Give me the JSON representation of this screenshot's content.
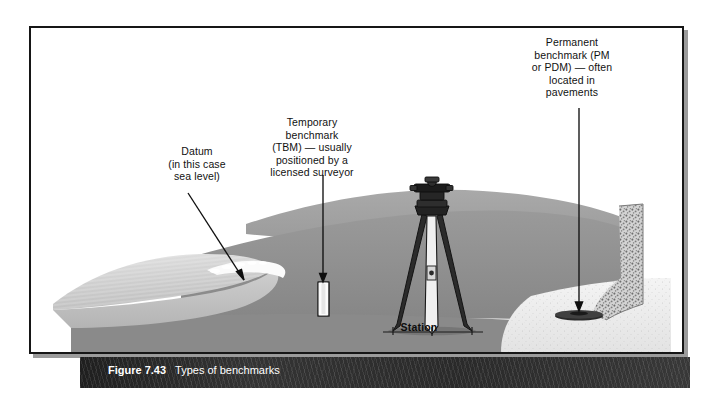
{
  "figure": {
    "number": "Figure 7.43",
    "title": "Types of benchmarks"
  },
  "labels": {
    "datum": "Datum\n(in this case\nsea level)",
    "temporary_benchmark": "Temporary\nbenchmark\n(TBM) — usually\npositioned by a\nlicensed surveyor",
    "permanent_benchmark": "Permanent\nbenchmark (PM\nor PDM) — often\nlocated in\npavements",
    "station": "Station"
  },
  "colors": {
    "frame_border": "#161616",
    "caption_bar": "#2c2c2c",
    "caption_text": "#ffffff",
    "ground_dark": "#8d8d8d",
    "ground_mid": "#a6a6a6",
    "sea_light": "#d8d8d8",
    "pavement": "#efefef",
    "instrument": "#1a1a1a",
    "leader_line": "#0f0f0f",
    "page_background": "#ffffff"
  },
  "scene_elements": {
    "sea": "sea-water-left",
    "shoreline": "shoreline-foam",
    "hillside": "grassy-hillside",
    "pavement": "paved-area-right",
    "curb": "concrete-curb",
    "tripod": "surveying-tripod-with-level",
    "tbm_post": "temporary-benchmark-post",
    "pbm_disc": "permanent-benchmark-disc"
  }
}
